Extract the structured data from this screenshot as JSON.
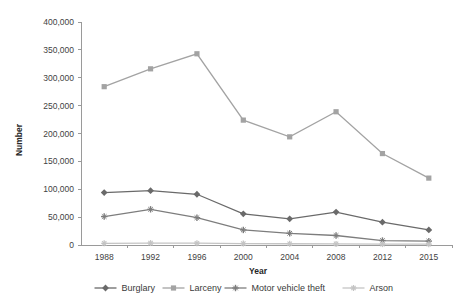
{
  "chart_data": {
    "type": "line",
    "title": "",
    "xlabel": "Year",
    "ylabel": "Number",
    "categories": [
      "1988",
      "1992",
      "1996",
      "2000",
      "2004",
      "2008",
      "2012",
      "2015"
    ],
    "x": [
      1988,
      1992,
      1996,
      2000,
      2004,
      2008,
      2012,
      2015
    ],
    "ylim": [
      0,
      400000
    ],
    "yticks": [
      0,
      50000,
      100000,
      150000,
      200000,
      250000,
      300000,
      350000,
      400000
    ],
    "ytick_labels": [
      "0",
      "50,000",
      "100,000",
      "150,000",
      "200,000",
      "250,000",
      "300,000",
      "350,000",
      "400,000"
    ],
    "grid": false,
    "legend_position": "bottom",
    "series": [
      {
        "name": "Burglary",
        "marker": "diamond",
        "color": "#6a6a6a",
        "values": [
          94000,
          97500,
          91000,
          56000,
          47000,
          59000,
          41000,
          27000
        ]
      },
      {
        "name": "Larceny",
        "marker": "square",
        "color": "#a3a3a3",
        "values": [
          284000,
          316000,
          343000,
          224000,
          194000,
          239000,
          164000,
          120000
        ]
      },
      {
        "name": "Motor vehicle theft",
        "marker": "cross",
        "color": "#7d7d7d",
        "values": [
          51000,
          64000,
          49000,
          27000,
          21000,
          17000,
          8000,
          7000
        ]
      },
      {
        "name": "Arson",
        "marker": "star",
        "color": "#c4c4c4",
        "values": [
          3000,
          3500,
          3200,
          2600,
          2200,
          2000,
          1600,
          1400
        ]
      }
    ]
  }
}
